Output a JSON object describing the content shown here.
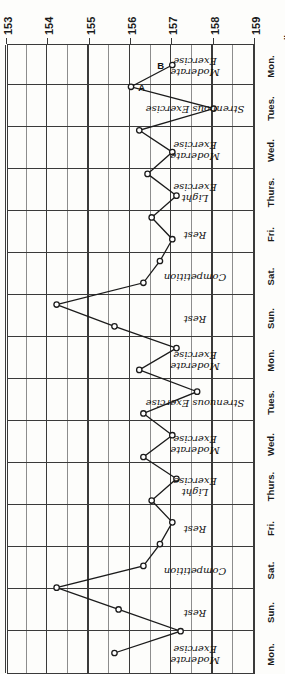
{
  "chart_data": {
    "type": "line",
    "title": "",
    "orientation": "rotated-180",
    "xlabel": "lbs.",
    "ylabel": "",
    "unit_label": "lbs.",
    "grid": true,
    "legend": "none",
    "x_axis": {
      "name": "weight",
      "unit": "lbs.",
      "ticks": [
        159,
        158,
        157,
        156,
        155,
        154,
        153
      ],
      "tick_labels": [
        "159",
        "158",
        "157",
        "156",
        "155",
        "154",
        "153"
      ],
      "range": [
        159,
        153
      ],
      "direction": "decreasing-left-to-right",
      "minor_divisions_per_major": 2
    },
    "y_axis": {
      "name": "day",
      "categories": [
        "Mon.",
        "Tues.",
        "Wed.",
        "Thurs.",
        "Fri.",
        "Sat.",
        "Sun.",
        "Mon.",
        "Tues.",
        "Wed.",
        "Thurs.",
        "Fri.",
        "Sat.",
        "Sun.",
        "Mon."
      ],
      "order": "bottom-to-top"
    },
    "annotations": [
      {
        "label": "A",
        "day": "Mon.",
        "weight": 156.0
      },
      {
        "label": "B",
        "day": "Mon.",
        "weight": 157.0
      }
    ],
    "activities": [
      "Moderate\nExercise",
      "Strenuous Exercise",
      "Moderate\nExercise",
      "Light\nExercise",
      "Rest",
      "Competition",
      "Rest",
      "Moderate\nExercise",
      "Strenuous Exercise",
      "Moderate\nExercise",
      "Light\nExercise",
      "Rest",
      "Competition",
      "Rest",
      "Moderate\nExercise"
    ],
    "categories": [
      "Mon.",
      "Tues.",
      "Wed.",
      "Thurs.",
      "Fri.",
      "Sat.",
      "Sun.",
      "Mon.",
      "Tues.",
      "Wed.",
      "Thurs.",
      "Fri.",
      "Sat.",
      "Sun.",
      "Mon."
    ],
    "values": [
      157.0,
      156.0,
      158.0,
      156.2,
      157.0,
      156.4,
      157.1,
      157.6,
      156.9,
      156.3,
      154.2,
      155.6,
      157.1,
      156.2,
      155.6
    ],
    "series": [
      {
        "name": "body weight",
        "points": [
          {
            "day": "Mon.",
            "index": 0,
            "weight": 157.0,
            "activity": "Moderate Exercise",
            "point_label": "B"
          },
          {
            "day": "Mon.",
            "index": 1,
            "weight": 156.0,
            "activity": "Moderate Exercise",
            "point_label": "A"
          },
          {
            "day": "Tues.",
            "index": 2,
            "weight": 158.0,
            "activity": "Strenuous Exercise",
            "point_label": ""
          },
          {
            "day": "Tues.",
            "index": 3,
            "weight": 156.2,
            "activity": "Strenuous Exercise",
            "point_label": ""
          },
          {
            "day": "Wed.",
            "index": 4,
            "weight": 157.0,
            "activity": "Moderate Exercise",
            "point_label": ""
          },
          {
            "day": "Wed.",
            "index": 5,
            "weight": 156.4,
            "activity": "Moderate Exercise",
            "point_label": ""
          },
          {
            "day": "Thurs.",
            "index": 6,
            "weight": 157.1,
            "activity": "Light Exercise",
            "point_label": ""
          },
          {
            "day": "Thurs.",
            "index": 7,
            "weight": 156.5,
            "activity": "Light Exercise",
            "point_label": ""
          },
          {
            "day": "Fri.",
            "index": 8,
            "weight": 157.0,
            "activity": "Rest",
            "point_label": ""
          },
          {
            "day": "Fri.",
            "index": 9,
            "weight": 156.7,
            "activity": "Rest",
            "point_label": ""
          },
          {
            "day": "Sat.",
            "index": 10,
            "weight": 156.3,
            "activity": "Competition",
            "point_label": ""
          },
          {
            "day": "Sat.",
            "index": 11,
            "weight": 154.2,
            "activity": "Competition",
            "point_label": ""
          },
          {
            "day": "Sun.",
            "index": 12,
            "weight": 155.6,
            "activity": "Rest",
            "point_label": ""
          },
          {
            "day": "Mon.",
            "index": 13,
            "weight": 157.1,
            "activity": "Moderate Exercise",
            "point_label": ""
          },
          {
            "day": "Mon.",
            "index": 14,
            "weight": 156.2,
            "activity": "Moderate Exercise",
            "point_label": ""
          },
          {
            "day": "Tues.",
            "index": 15,
            "weight": 157.6,
            "activity": "Strenuous Exercise",
            "point_label": ""
          },
          {
            "day": "Tues.",
            "index": 16,
            "weight": 156.3,
            "activity": "Strenuous Exercise",
            "point_label": ""
          },
          {
            "day": "Wed.",
            "index": 17,
            "weight": 157.0,
            "activity": "Moderate Exercise",
            "point_label": ""
          },
          {
            "day": "Wed.",
            "index": 18,
            "weight": 156.3,
            "activity": "Moderate Exercise",
            "point_label": ""
          },
          {
            "day": "Thurs.",
            "index": 19,
            "weight": 157.1,
            "activity": "Light Exercise",
            "point_label": ""
          },
          {
            "day": "Thurs.",
            "index": 20,
            "weight": 156.5,
            "activity": "Light Exercise",
            "point_label": ""
          },
          {
            "day": "Fri.",
            "index": 21,
            "weight": 157.0,
            "activity": "Rest",
            "point_label": ""
          },
          {
            "day": "Fri.",
            "index": 22,
            "weight": 156.7,
            "activity": "Rest",
            "point_label": ""
          },
          {
            "day": "Sat.",
            "index": 23,
            "weight": 156.3,
            "activity": "Competition",
            "point_label": ""
          },
          {
            "day": "Sat.",
            "index": 24,
            "weight": 154.2,
            "activity": "Competition",
            "point_label": ""
          },
          {
            "day": "Sun.",
            "index": 25,
            "weight": 155.7,
            "activity": "Rest",
            "point_label": ""
          },
          {
            "day": "Mon.",
            "index": 26,
            "weight": 157.2,
            "activity": "Moderate Exercise",
            "point_label": ""
          },
          {
            "day": "Mon.",
            "index": 27,
            "weight": 155.6,
            "activity": "Moderate Exercise",
            "point_label": ""
          }
        ]
      }
    ]
  },
  "axis": {
    "unit_label": "lbs."
  },
  "days": [
    {
      "label": "Mon.",
      "activity": "Moderate\nExercise"
    },
    {
      "label": "Tues.",
      "activity": "Strenuous Exercise"
    },
    {
      "label": "Wed.",
      "activity": "Moderate\nExercise"
    },
    {
      "label": "Thurs.",
      "activity": "Light\nExercise"
    },
    {
      "label": "Fri.",
      "activity": "Rest"
    },
    {
      "label": "Sat.",
      "activity": "Competition"
    },
    {
      "label": "Sun.",
      "activity": "Rest"
    },
    {
      "label": "Mon.",
      "activity": "Moderate\nExercise"
    },
    {
      "label": "Tues.",
      "activity": "Strenuous Exercise"
    },
    {
      "label": "Wed.",
      "activity": "Moderate\nExercise"
    },
    {
      "label": "Thurs.",
      "activity": "Light\nExercise"
    },
    {
      "label": "Fri.",
      "activity": "Rest"
    },
    {
      "label": "Sat.",
      "activity": "Competition"
    },
    {
      "label": "Sun.",
      "activity": "Rest"
    },
    {
      "label": "Mon.",
      "activity": "Moderate\nExercise"
    }
  ],
  "point_labels": [
    {
      "text": "A"
    },
    {
      "text": "B"
    }
  ],
  "colors": {
    "ink": "#1b1b1b",
    "grid_major": "#3a3a3a",
    "grid_minor": "#8d8d8d",
    "paper": "#fdfdfb"
  }
}
